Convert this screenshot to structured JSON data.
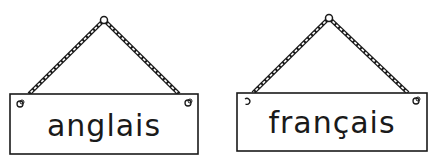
{
  "signs": [
    {
      "label": "anglais"
    },
    {
      "label": "français"
    }
  ],
  "colors": {
    "ink": "#1a1a1a",
    "background": "#ffffff"
  }
}
